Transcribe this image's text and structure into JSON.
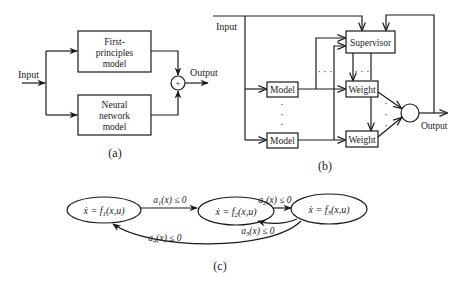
{
  "panel_a": {
    "caption": "(a)",
    "input_label": "Input",
    "output_label": "Output",
    "top_box": {
      "line1": "First-",
      "line2": "principles",
      "line3": "model"
    },
    "bottom_box": {
      "line1": "Neural",
      "line2": "network",
      "line3": "model"
    },
    "sum_symbol": "+"
  },
  "panel_b": {
    "caption": "(b)",
    "input_label": "Input",
    "output_label": "Output",
    "supervisor_label": "Supervisor",
    "model_labels": [
      "Model",
      "Model"
    ],
    "weight_labels": [
      "Weight",
      "Weight"
    ],
    "ellipsis_h": "· · ·",
    "ellipsis_v": "·"
  },
  "panel_c": {
    "caption": "(c)",
    "states": [
      {
        "lhs": "ẋ = f",
        "sub": "1",
        "args": "(x,u)"
      },
      {
        "lhs": "ẋ = f",
        "sub": "2",
        "args": "(x,u)"
      },
      {
        "lhs": "ẋ = f",
        "sub": "3",
        "args": "(x,u)"
      }
    ],
    "transitions": [
      {
        "from": 1,
        "to": 2,
        "var": "a",
        "sub": "1",
        "cond": "(x) ≤ 0"
      },
      {
        "from": 2,
        "to": 3,
        "var": "a",
        "sub": "2",
        "cond": "(x) ≤ 0"
      },
      {
        "from": 3,
        "to": 2,
        "var": "a",
        "sub": "3",
        "cond": "(x) ≤ 0"
      },
      {
        "from": 3,
        "to": 1,
        "var": "a",
        "sub": "4",
        "cond": "(x) ≤ 0"
      }
    ]
  }
}
